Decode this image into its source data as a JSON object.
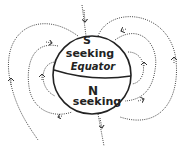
{
  "diagram": {
    "labels": {
      "top_pole": "S",
      "top_region": "seeking",
      "equator": "Equator",
      "bottom_pole": "N",
      "bottom_region": "seeking"
    },
    "colors": {
      "line": "#222222",
      "field": "#444444",
      "background": "#ffffff"
    }
  }
}
